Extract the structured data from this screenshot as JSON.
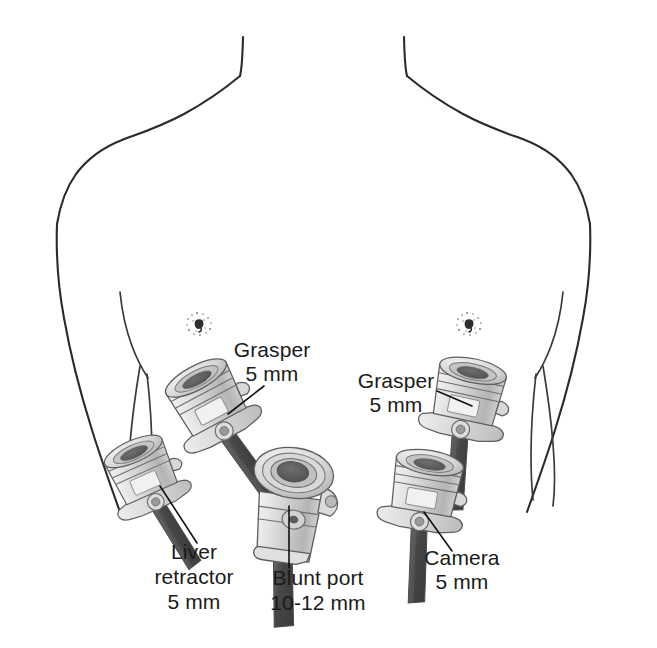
{
  "figure": {
    "background_color": "#ffffff",
    "outline_color": "#2b2b2b",
    "label_color": "#1a1a1a",
    "trocar_fill_light": "#e8e8e8",
    "trocar_fill_mid": "#cdcdcd",
    "trocar_fill_dark": "#a8a8a8",
    "shaft_color": "#4a4a4a",
    "lumen_color": "#585858"
  },
  "anatomy": {
    "torso_label": "torso-outline",
    "neck_left_label": "neck-left-line",
    "neck_right_label": "neck-right-line",
    "shoulder_left_label": "shoulder-left-line",
    "shoulder_right_label": "shoulder-right-line",
    "flank_left_label": "flank-left-line",
    "flank_right_label": "flank-right-line",
    "costal_margin_left_label": "costal-margin-left",
    "costal_margin_right_label": "costal-margin-right",
    "nipple_left_label": "nipple-marker-left",
    "nipple_right_label": "nipple-marker-right"
  },
  "ports": [
    {
      "id": "grasper-left",
      "name": "Grasper",
      "size": "5 mm",
      "label_lines": [
        "Grasper",
        "5 mm"
      ],
      "label_x": 272,
      "label_y_first": 357,
      "label_y_second": 381,
      "label_anchor": "middle",
      "port_type": "valved-trocar",
      "port_cx": 212,
      "port_cy": 408,
      "rotation": -28,
      "scale": 1.0,
      "leader_from_x": 262,
      "leader_from_y": 387,
      "leader_to_x": 228,
      "leader_to_y": 414
    },
    {
      "id": "liver-retractor",
      "name": "Liver retractor",
      "size": "5 mm",
      "label_lines": [
        "Liver",
        "retractor",
        "5 mm"
      ],
      "label_x": 192,
      "label_y_first": 559,
      "label_y_second": 584,
      "label_y_third": 609,
      "label_anchor": "middle",
      "port_type": "valved-trocar",
      "port_cx": 146,
      "port_cy": 480,
      "rotation": -24,
      "scale": 0.92,
      "leader_from_x": 196,
      "leader_from_y": 545,
      "leader_to_x": 158,
      "leader_to_y": 488
    },
    {
      "id": "blunt-port",
      "name": "Blunt port",
      "size": "10-12 mm",
      "label_lines": [
        "Blunt port",
        "10-12 mm"
      ],
      "label_x": 318,
      "label_y_first": 585,
      "label_y_second": 610,
      "label_anchor": "middle",
      "port_type": "blunt-large-port",
      "port_cx": 290,
      "port_cy": 500,
      "rotation": 8,
      "scale": 1.12,
      "leader_from_x": 290,
      "leader_from_y": 568,
      "leader_to_x": 290,
      "leader_to_y": 508
    },
    {
      "id": "grasper-right",
      "name": "Grasper",
      "size": "5 mm",
      "label_lines": [
        "Grasper",
        "5 mm"
      ],
      "label_x": 396,
      "label_y_first": 388,
      "label_y_second": 412,
      "label_anchor": "middle",
      "port_type": "valved-trocar",
      "port_cx": 466,
      "port_cy": 404,
      "rotation": 12,
      "scale": 1.0,
      "leader_from_x": 437,
      "leader_from_y": 392,
      "leader_to_x": 470,
      "leader_to_y": 406
    },
    {
      "id": "camera",
      "name": "Camera",
      "size": "5 mm",
      "label_lines": [
        "Camera",
        "5 mm"
      ],
      "label_x": 462,
      "label_y_first": 565,
      "label_y_second": 589,
      "label_anchor": "middle",
      "port_type": "valved-trocar",
      "port_cx": 424,
      "port_cy": 496,
      "rotation": 10,
      "scale": 1.0,
      "leader_from_x": 450,
      "leader_from_y": 552,
      "leader_to_x": 424,
      "leader_to_y": 513
    }
  ],
  "labels": {
    "grasper_left_line1": "Grasper",
    "grasper_left_line2": "5 mm",
    "liver_line1": "Liver",
    "liver_line2": "retractor",
    "liver_line3": "5 mm",
    "blunt_line1": "Blunt port",
    "blunt_line2": "10-12 mm",
    "grasper_right_line1": "Grasper",
    "grasper_right_line2": "5 mm",
    "camera_line1": "Camera",
    "camera_line2": "5 mm"
  }
}
